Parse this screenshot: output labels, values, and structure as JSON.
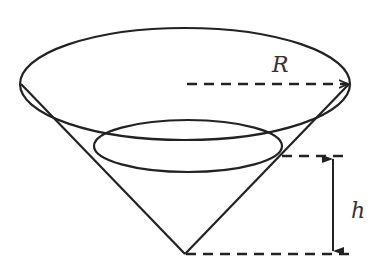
{
  "diagram": {
    "labels": {
      "radius": "R",
      "height": "h"
    },
    "colors": {
      "stroke": "#222222",
      "background": "#ffffff"
    },
    "shapes": {
      "top_ellipse": {
        "cx": 185,
        "cy": 84,
        "rx": 165,
        "ry": 56
      },
      "inner_ellipse": {
        "cx": 188,
        "cy": 146,
        "rx": 94,
        "ry": 26
      },
      "apex": {
        "x": 185,
        "y": 254
      }
    }
  }
}
